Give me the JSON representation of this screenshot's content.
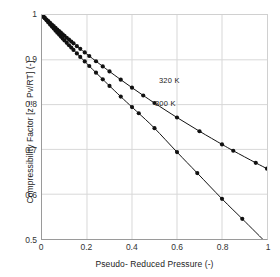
{
  "chart_data": {
    "type": "scatter",
    "title": "",
    "xlabel": "Pseudo- Reduced Pressure (-)",
    "ylabel": "Compressibility Factor [z = Pv/RT] (-)",
    "xlim": [
      0,
      1
    ],
    "ylim": [
      0.5,
      1
    ],
    "grid": true,
    "legend_position": "inline-annotation",
    "xticks": [
      "0",
      "0.2",
      "0.4",
      "0.6",
      "0.8",
      "1"
    ],
    "xtick_values": [
      0,
      0.2,
      0.4,
      0.6,
      0.8,
      1
    ],
    "yticks": [
      "0.5",
      "0.6",
      "0.7",
      "0.8",
      "0.9",
      "1"
    ],
    "ytick_values": [
      0.5,
      0.6,
      0.7,
      0.8,
      0.9,
      1.0
    ],
    "series": [
      {
        "name": "320 K",
        "label": "320 K",
        "color": "#111111",
        "marker": "filled-circle",
        "x": [
          0.005,
          0.012,
          0.02,
          0.028,
          0.036,
          0.044,
          0.052,
          0.06,
          0.068,
          0.076,
          0.084,
          0.092,
          0.1,
          0.11,
          0.12,
          0.13,
          0.14,
          0.155,
          0.17,
          0.19,
          0.21,
          0.24,
          0.27,
          0.3,
          0.35,
          0.4,
          0.45,
          0.5,
          0.6,
          0.7,
          0.8,
          0.85,
          0.95,
          1.0
        ],
        "y": [
          0.9975,
          0.994,
          0.99,
          0.9862,
          0.9824,
          0.9787,
          0.975,
          0.9713,
          0.9677,
          0.9641,
          0.9606,
          0.9571,
          0.9536,
          0.9493,
          0.9451,
          0.9409,
          0.9367,
          0.9305,
          0.9244,
          0.9164,
          0.9085,
          0.8968,
          0.8853,
          0.874,
          0.8556,
          0.8378,
          0.8204,
          0.8035,
          0.7712,
          0.7405,
          0.7112,
          0.697,
          0.67,
          0.657
        ]
      },
      {
        "name": "300 K",
        "label": "300 K",
        "color": "#111111",
        "marker": "filled-circle",
        "x": [
          0.005,
          0.012,
          0.02,
          0.028,
          0.036,
          0.044,
          0.052,
          0.06,
          0.068,
          0.076,
          0.084,
          0.092,
          0.1,
          0.11,
          0.12,
          0.13,
          0.14,
          0.155,
          0.17,
          0.19,
          0.21,
          0.24,
          0.27,
          0.3,
          0.35,
          0.4,
          0.43,
          0.5,
          0.6,
          0.69,
          0.8,
          0.89,
          1.0
        ],
        "y": [
          0.997,
          0.9928,
          0.988,
          0.9833,
          0.9787,
          0.9741,
          0.9696,
          0.9651,
          0.9606,
          0.9562,
          0.9518,
          0.9474,
          0.9431,
          0.9378,
          0.9325,
          0.9272,
          0.922,
          0.9142,
          0.9065,
          0.8963,
          0.8862,
          0.8712,
          0.8564,
          0.8418,
          0.8178,
          0.7944,
          0.7806,
          0.7474,
          0.694,
          0.6472,
          0.5896,
          0.545,
          0.49
        ]
      }
    ],
    "annotations": [
      {
        "text": "320 K",
        "x": 0.53,
        "y": 0.845
      },
      {
        "text": "300 K",
        "x": 0.5,
        "y": 0.793
      }
    ],
    "colors": {
      "background": "#ffffff",
      "grid": "#d8d8d8",
      "axis": "#9a9a9a",
      "data": "#111111",
      "text": "#222222"
    }
  }
}
